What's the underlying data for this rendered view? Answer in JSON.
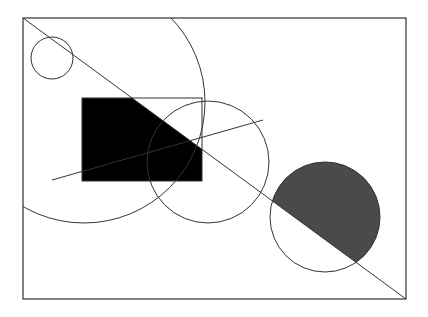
{
  "diagram": {
    "type": "geometric-figure",
    "canvas": {
      "width": 428,
      "height": 317,
      "background": "#ffffff"
    },
    "colors": {
      "stroke": "#333333",
      "fill_black": "#000000",
      "fill_gray": "#4a4a4a"
    },
    "frame": {
      "x": 23,
      "y": 18,
      "width": 383,
      "height": 281
    },
    "diagonal_line": {
      "x1": 23,
      "y1": 18,
      "x2": 406,
      "y2": 299
    },
    "small_circle": {
      "cx": 52,
      "cy": 58,
      "r": 21
    },
    "large_circle": {
      "cx": 84,
      "cy": 102,
      "r": 121
    },
    "black_rectangle": {
      "x": 82,
      "y": 98,
      "width": 120,
      "height": 83
    },
    "middle_circle": {
      "cx": 208,
      "cy": 162,
      "r": 61
    },
    "chord_line": {
      "x1": 52,
      "y1": 180,
      "x2": 263,
      "y2": 120
    },
    "bottom_circle": {
      "cx": 325,
      "cy": 217,
      "r": 55
    }
  }
}
